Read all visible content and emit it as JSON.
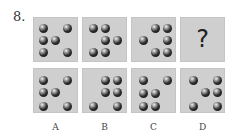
{
  "question": {
    "number": "8.",
    "unknown_symbol": "?"
  },
  "colors": {
    "panel_background": "#cfcfcf",
    "dot": "#1a1a1a"
  },
  "sequence": [
    {
      "dots": [
        [
          10,
          11
        ],
        [
          34,
          11
        ],
        [
          10,
          23
        ],
        [
          22,
          23
        ],
        [
          10,
          35
        ],
        [
          34,
          35
        ]
      ]
    },
    {
      "dots": [
        [
          11,
          11
        ],
        [
          23,
          11
        ],
        [
          23,
          23
        ],
        [
          35,
          23
        ],
        [
          11,
          35
        ],
        [
          23,
          35
        ]
      ]
    },
    {
      "dots": [
        [
          24,
          11
        ],
        [
          36,
          11
        ],
        [
          12,
          23
        ],
        [
          36,
          23
        ],
        [
          24,
          35
        ],
        [
          36,
          35
        ]
      ]
    },
    {
      "dots": [],
      "unknown": true
    }
  ],
  "options": [
    {
      "label": "A",
      "dots": [
        [
          10,
          12
        ],
        [
          34,
          12
        ],
        [
          10,
          24
        ],
        [
          22,
          24
        ],
        [
          10,
          38
        ],
        [
          34,
          38
        ]
      ]
    },
    {
      "label": "B",
      "dots": [
        [
          23,
          12
        ],
        [
          35,
          12
        ],
        [
          23,
          24
        ],
        [
          35,
          24
        ],
        [
          11,
          38
        ],
        [
          35,
          38
        ]
      ]
    },
    {
      "label": "C",
      "dots": [
        [
          12,
          12
        ],
        [
          36,
          12
        ],
        [
          12,
          25
        ],
        [
          24,
          25
        ],
        [
          12,
          38
        ],
        [
          24,
          38
        ]
      ]
    },
    {
      "label": "D",
      "dots": [
        [
          13,
          12
        ],
        [
          37,
          12
        ],
        [
          25,
          24
        ],
        [
          37,
          24
        ],
        [
          13,
          38
        ],
        [
          37,
          38
        ]
      ]
    }
  ]
}
